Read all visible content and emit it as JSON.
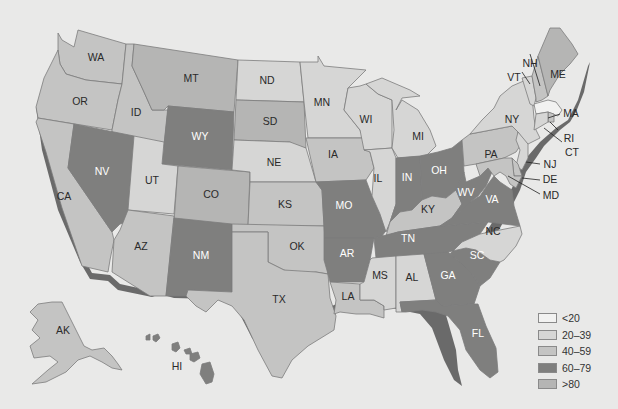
{
  "legend": {
    "bins": [
      {
        "label": "<20",
        "color": "#f2f2f1"
      },
      {
        "label": "20–39",
        "color": "#d6d6d5"
      },
      {
        "label": "40–59",
        "color": "#c4c4c3"
      },
      {
        "label": "60–79",
        "color": "#7f7f7e"
      },
      {
        "label": ">80",
        "color": "#b5b5b4"
      }
    ]
  },
  "states": {
    "WA": {
      "label": "WA",
      "bin": "40–59"
    },
    "OR": {
      "label": "OR",
      "bin": "40–59"
    },
    "CA": {
      "label": "CA",
      "bin": "40–59"
    },
    "ID": {
      "label": "ID",
      "bin": "40–59"
    },
    "NV": {
      "label": "NV",
      "bin": "60–79"
    },
    "MT": {
      "label": "MT",
      "bin": ">80"
    },
    "WY": {
      "label": "WY",
      "bin": "60–79"
    },
    "UT": {
      "label": "UT",
      "bin": "20–39"
    },
    "CO": {
      "label": "CO",
      "bin": ">80"
    },
    "AZ": {
      "label": "AZ",
      "bin": "40–59"
    },
    "NM": {
      "label": "NM",
      "bin": "60–79"
    },
    "ND": {
      "label": "ND",
      "bin": "20–39"
    },
    "SD": {
      "label": "SD",
      "bin": ">80"
    },
    "NE": {
      "label": "NE",
      "bin": "20–39"
    },
    "KS": {
      "label": "KS",
      "bin": "40–59"
    },
    "OK": {
      "label": "OK",
      "bin": "40–59"
    },
    "TX": {
      "label": "TX",
      "bin": "40–59"
    },
    "MN": {
      "label": "MN",
      "bin": "20–39"
    },
    "IA": {
      "label": "IA",
      "bin": "40–59"
    },
    "MO": {
      "label": "MO",
      "bin": "60–79"
    },
    "AR": {
      "label": "AR",
      "bin": "60–79"
    },
    "LA": {
      "label": "LA",
      "bin": "40–59"
    },
    "WI": {
      "label": "WI",
      "bin": "20–39"
    },
    "IL": {
      "label": "IL",
      "bin": "20–39"
    },
    "MI": {
      "label": "MI",
      "bin": "20–39"
    },
    "IN": {
      "label": "IN",
      "bin": "60–79"
    },
    "OH": {
      "label": "OH",
      "bin": "60–79"
    },
    "KY": {
      "label": "KY",
      "bin": "40–59"
    },
    "TN": {
      "label": "TN",
      "bin": "60–79"
    },
    "MS": {
      "label": "MS",
      "bin": "20–39"
    },
    "AL": {
      "label": "AL",
      "bin": "20–39"
    },
    "GA": {
      "label": "GA",
      "bin": "60–79"
    },
    "FL": {
      "label": "FL",
      "bin": "60–79"
    },
    "SC": {
      "label": "SC",
      "bin": "60–79"
    },
    "NC": {
      "label": "NC",
      "bin": "20–39"
    },
    "VA": {
      "label": "VA",
      "bin": "60–79"
    },
    "WV": {
      "label": "WV",
      "bin": "60–79"
    },
    "PA": {
      "label": "PA",
      "bin": "40–59"
    },
    "NY": {
      "label": "NY",
      "bin": "20–39"
    },
    "VT": {
      "label": "VT",
      "bin": "20–39"
    },
    "NH": {
      "label": "NH",
      "bin": "40–59"
    },
    "ME": {
      "label": "ME",
      "bin": ">80"
    },
    "MA": {
      "label": "MA",
      "bin": "<20"
    },
    "RI": {
      "label": "RI",
      "bin": "40–59"
    },
    "CT": {
      "label": "CT",
      "bin": "20–39"
    },
    "NJ": {
      "label": "NJ",
      "bin": "20–39"
    },
    "DE": {
      "label": "DE",
      "bin": "40–59"
    },
    "MD": {
      "label": "MD",
      "bin": "40–59"
    },
    "AK": {
      "label": "AK",
      "bin": "40–59"
    },
    "HI": {
      "label": "HI",
      "bin": "60–79"
    }
  }
}
